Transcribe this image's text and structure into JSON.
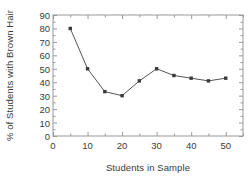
{
  "chart_data": {
    "type": "line",
    "title": "",
    "xlabel": "Students in Sample",
    "ylabel": "% of Students with Brown Hair",
    "x": [
      5,
      10,
      15,
      20,
      25,
      30,
      35,
      40,
      45,
      50
    ],
    "values": [
      80,
      50,
      33,
      30,
      41,
      50,
      45,
      43,
      41,
      43
    ],
    "series": [
      {
        "name": "% of Students with Brown Hair",
        "values": [
          80,
          50,
          33,
          30,
          41,
          50,
          45,
          43,
          41,
          43
        ]
      }
    ],
    "xlim": [
      0,
      55
    ],
    "ylim": [
      0,
      90
    ],
    "xticks": [
      0,
      10,
      20,
      30,
      40,
      50
    ],
    "xtick_labels": [
      "0",
      "10",
      "20",
      "30",
      "40",
      "50"
    ],
    "xticks_minor": [
      5,
      15,
      25,
      35,
      45,
      55
    ],
    "yticks": [
      0,
      10,
      20,
      30,
      40,
      50,
      60,
      70,
      80,
      90
    ],
    "ytick_labels": [
      "0",
      "10",
      "20",
      "30",
      "40",
      "50",
      "60",
      "70",
      "80",
      "90"
    ],
    "grid": false,
    "legend": null,
    "frame": "box",
    "line_color": "#555555",
    "marker_color": "#3a3a3a",
    "marker": "square",
    "axis_color": "#999999",
    "text_color": "#3a3a3a",
    "background": "#ffffff"
  }
}
